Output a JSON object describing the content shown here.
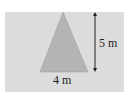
{
  "diagram": {
    "shape": "triangle",
    "height_label": "5 m",
    "base_label": "4 m",
    "colors": {
      "background_panel": "#dcdcdc",
      "triangle_fill": "#b4b4b4",
      "arrow": "#222222"
    }
  }
}
